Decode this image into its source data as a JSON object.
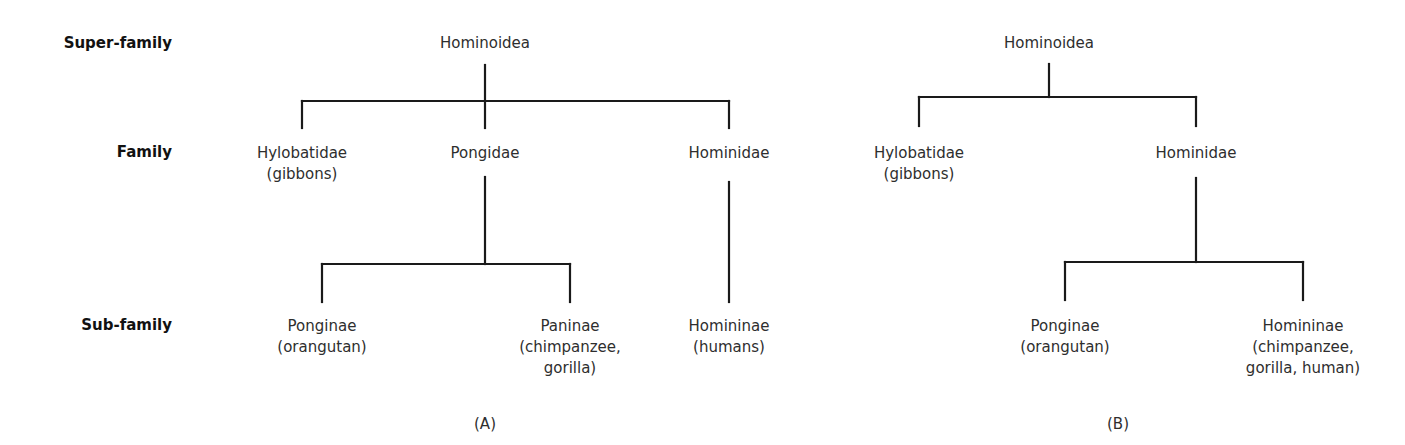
{
  "ranks": [
    {
      "label": "Super-family",
      "right": 172,
      "top": 34
    },
    {
      "label": "Family",
      "right": 172,
      "top": 143
    },
    {
      "label": "Sub-family",
      "right": 172,
      "top": 316
    }
  ],
  "panels": [
    {
      "id": "A",
      "caption": "(A)",
      "caption_x": 485,
      "caption_y": 415,
      "nodes": [
        {
          "name": "hominoidea",
          "lines": [
            "Hominoidea"
          ],
          "x": 485,
          "y": 33
        },
        {
          "name": "hylobatidae",
          "lines": [
            "Hylobatidae",
            "(gibbons)"
          ],
          "x": 302,
          "y": 143
        },
        {
          "name": "pongidae",
          "lines": [
            "Pongidae"
          ],
          "x": 485,
          "y": 143
        },
        {
          "name": "hominidae",
          "lines": [
            "Hominidae"
          ],
          "x": 729,
          "y": 143
        },
        {
          "name": "ponginae",
          "lines": [
            "Ponginae",
            "(orangutan)"
          ],
          "x": 322,
          "y": 316
        },
        {
          "name": "paninae",
          "lines": [
            "Paninae",
            "(chimpanzee,",
            "gorilla)"
          ],
          "x": 570,
          "y": 316
        },
        {
          "name": "homininae",
          "lines": [
            "Homininae",
            "(humans)"
          ],
          "x": 729,
          "y": 316
        }
      ],
      "edges": [
        [
          485,
          65,
          485,
          128
        ],
        [
          302,
          101,
          729,
          101
        ],
        [
          302,
          101,
          302,
          128
        ],
        [
          729,
          101,
          729,
          128
        ],
        [
          485,
          177,
          485,
          264
        ],
        [
          322,
          264,
          570,
          264
        ],
        [
          322,
          264,
          322,
          302
        ],
        [
          570,
          264,
          570,
          302
        ],
        [
          729,
          182,
          729,
          302
        ]
      ]
    },
    {
      "id": "B",
      "caption": "(B)",
      "caption_x": 1118,
      "caption_y": 415,
      "nodes": [
        {
          "name": "hominoidea",
          "lines": [
            "Hominoidea"
          ],
          "x": 1049,
          "y": 33
        },
        {
          "name": "hylobatidae",
          "lines": [
            "Hylobatidae",
            "(gibbons)"
          ],
          "x": 919,
          "y": 143
        },
        {
          "name": "hominidae",
          "lines": [
            "Hominidae"
          ],
          "x": 1196,
          "y": 143
        },
        {
          "name": "ponginae",
          "lines": [
            "Ponginae",
            "(orangutan)"
          ],
          "x": 1065,
          "y": 316
        },
        {
          "name": "homininae",
          "lines": [
            "Homininae",
            "(chimpanzee,",
            "gorilla, human)"
          ],
          "x": 1303,
          "y": 316
        }
      ],
      "edges": [
        [
          1049,
          64,
          1049,
          97
        ],
        [
          919,
          97,
          1196,
          97
        ],
        [
          919,
          97,
          919,
          126
        ],
        [
          1196,
          97,
          1196,
          126
        ],
        [
          1196,
          178,
          1196,
          262
        ],
        [
          1065,
          262,
          1303,
          262
        ],
        [
          1065,
          262,
          1065,
          300
        ],
        [
          1303,
          262,
          1303,
          300
        ]
      ]
    }
  ],
  "style": {
    "line_color": "#1a1a1a",
    "line_width": 2.2
  }
}
